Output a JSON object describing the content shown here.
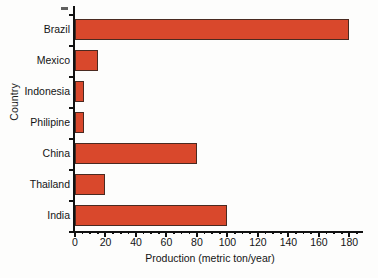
{
  "chart_data": {
    "type": "bar",
    "orientation": "horizontal",
    "title": "",
    "xlabel": "Production (metric ton/year)",
    "ylabel": "Country",
    "categories": [
      "Brazil",
      "Mexico",
      "Indonesia",
      "Philipine",
      "China",
      "Thailand",
      "India"
    ],
    "values": [
      180,
      15,
      6,
      6,
      80,
      20,
      100
    ],
    "xlim": [
      0,
      185
    ],
    "xticks": [
      0,
      20,
      40,
      60,
      80,
      100,
      120,
      140,
      160,
      180
    ],
    "xtick_labels": [
      "0",
      "20",
      "40",
      "60",
      "80",
      "100",
      "120",
      "140",
      "160",
      "180"
    ],
    "minor_tick_interval": 5,
    "grid": false,
    "legend": false,
    "bar_color": "#d9482c",
    "bar_edge_color": "#4a2a21",
    "axis_color": "#111111",
    "background_color": "#fdfdfc"
  },
  "annotations": {
    "scan_artifact": "dash-mark"
  }
}
